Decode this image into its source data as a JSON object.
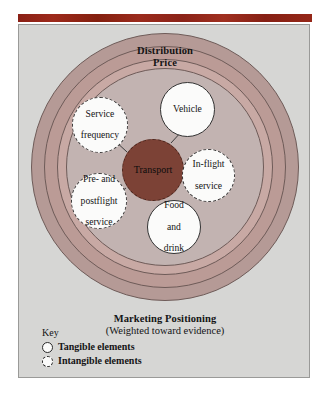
{
  "figure": {
    "outer_ring_label_line1": "Distribution",
    "outer_ring_label_line2": "Price",
    "bottom_label_title": "Marketing Positioning",
    "bottom_label_subtitle": "(Weighted toward evidence)",
    "center_node": "Transport",
    "nodes": [
      {
        "id": "service-frequency",
        "line1": "Service",
        "line2": "frequency",
        "line3": "",
        "type": "intangible"
      },
      {
        "id": "vehicle",
        "line1": "Vehicle",
        "line2": "",
        "line3": "",
        "type": "tangible"
      },
      {
        "id": "in-flight-service",
        "line1": "In-flight",
        "line2": "service",
        "line3": "",
        "type": "intangible"
      },
      {
        "id": "food-and-drink",
        "line1": "Food",
        "line2": "and",
        "line3": "drink",
        "type": "tangible"
      },
      {
        "id": "pre-and-postflight-service",
        "line1": "Pre- and",
        "line2": "postflight",
        "line3": "service",
        "type": "intangible"
      }
    ]
  },
  "key": {
    "title": "Key",
    "items": [
      {
        "label": "Tangible elements",
        "style": "solid-circle"
      },
      {
        "label": "Intangible elements",
        "style": "dashed-circle"
      }
    ]
  },
  "colors": {
    "top_rule": "#8e2116",
    "panel_background": "#d6d6d4",
    "ring_outer": "#b59a96",
    "ring_middle": "#bb9b96",
    "ring_inner_edge": "#c8a9a4",
    "ring_core": "#c2b3b1",
    "center_node": "#7c4236",
    "node_fill": "#fbfbfa",
    "stroke": "#6e5b58",
    "text": "#141414"
  }
}
